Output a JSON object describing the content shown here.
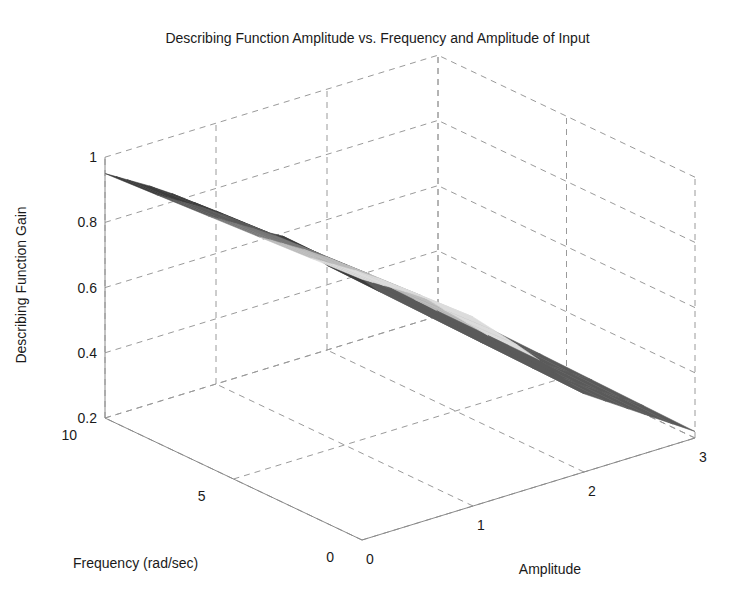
{
  "chart_data": {
    "type": "surface3d",
    "title": "Describing Function Amplitude vs. Frequency and Amplitude of Input",
    "xlabel": "Amplitude",
    "ylabel": "Frequency (rad/sec)",
    "zlabel": "Describing Function Gain",
    "xlim": [
      0,
      3
    ],
    "ylim": [
      0,
      10
    ],
    "zlim": [
      0.2,
      1
    ],
    "xticks": [
      "0",
      "1",
      "2",
      "3"
    ],
    "yticks": [
      "0",
      "5",
      "10"
    ],
    "zticks": [
      "0.2",
      "0.4",
      "0.6",
      "0.8",
      "1"
    ],
    "grid": true,
    "colormap": "gray",
    "amplitude": [
      0.0,
      0.1,
      0.2,
      0.4,
      0.6,
      0.8,
      1.0,
      1.2,
      1.4,
      1.6,
      1.8,
      2.0,
      2.2,
      2.4,
      2.6,
      2.8,
      3.0
    ],
    "frequency_bands": [
      10,
      8,
      6,
      4,
      2,
      0
    ],
    "describing_function_gain_note": "Gain ~1 at small amplitude, falls roughly linearly with amplitude to ~0.22 at amplitude 3; steep drop across frequency near amplitude 1.5",
    "gain_profile": {
      "amplitude": [
        0.0,
        0.5,
        1.0,
        1.5,
        2.0,
        2.5,
        3.0
      ],
      "gain": [
        1.0,
        0.9,
        0.78,
        0.62,
        0.44,
        0.33,
        0.22
      ]
    }
  }
}
